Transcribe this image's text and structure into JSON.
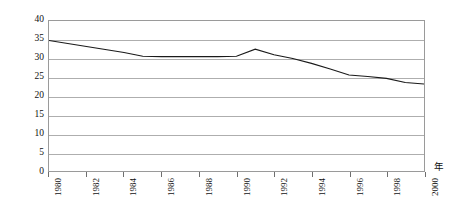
{
  "chart_data": {
    "type": "line",
    "title": "",
    "subtitle": "",
    "xlabel": "年",
    "ylabel": "致死數/非致命傷害數(%)",
    "xlim": [
      1980,
      2000
    ],
    "ylim": [
      0,
      40
    ],
    "ytick_step": 5,
    "xtick_step": 2,
    "grid": true,
    "grid_axis": "y",
    "legend": false,
    "legend_position": "none",
    "yticks": [
      0,
      5,
      10,
      15,
      20,
      25,
      30,
      35,
      40
    ],
    "ytick_labels": [
      "0",
      "5",
      "10",
      "15",
      "20",
      "25",
      "30",
      "35",
      "40"
    ],
    "xticks": [
      1980,
      1982,
      1984,
      1986,
      1988,
      1990,
      1992,
      1994,
      1996,
      1998,
      2000
    ],
    "xtick_labels": [
      "1980",
      "1982",
      "1984",
      "1986",
      "1988",
      "1990",
      "1992",
      "1994",
      "1996",
      "1998",
      "2000"
    ],
    "x": [
      1980,
      1981,
      1982,
      1983,
      1984,
      1985,
      1986,
      1987,
      1988,
      1989,
      1990,
      1991,
      1992,
      1993,
      1994,
      1995,
      1996,
      1997,
      1998,
      1999,
      2000
    ],
    "series": [
      {
        "name": "致死數/非致命傷害數",
        "color": "#1a1a1a",
        "values": [
          34.8,
          34.0,
          33.2,
          32.4,
          31.6,
          30.6,
          30.5,
          30.5,
          30.5,
          30.5,
          30.6,
          32.5,
          31.0,
          30.0,
          28.7,
          27.2,
          25.6,
          25.2,
          24.7,
          23.6,
          23.2
        ]
      }
    ],
    "annotations": []
  },
  "axes": {
    "y_title": "致死數/非致命傷害數(%)",
    "x_unit": "年"
  }
}
